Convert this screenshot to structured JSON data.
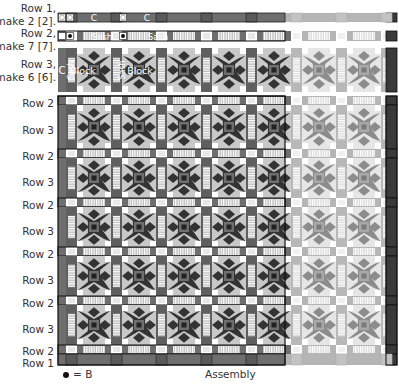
{
  "title": "Assembly",
  "legend": {
    "symbol": "•",
    "text": "= B"
  },
  "rows_top": [
    {
      "label_line1": "Row 1,",
      "label_line2": "make 2 [2]."
    },
    {
      "label_line1": "Row 2,",
      "label_line2": "make 7 [7]."
    },
    {
      "label_line1": "Row 3,",
      "label_line2": "make 6 [6]."
    }
  ],
  "piece_labels": {
    "c": "C",
    "sash": "Sash",
    "block": "Block"
  },
  "assembly_row_labels": [
    "Row 2",
    "Row 3",
    "Row 2",
    "Row 3",
    "Row 2",
    "Row 3",
    "Row 2",
    "Row 3",
    "Row 2",
    "Row 3",
    "Row 2",
    "Row 1"
  ],
  "colors": {
    "dark": "#3a3a3a",
    "mid": "#6e6e6e",
    "light": "#c8c8c8",
    "white": "#ffffff",
    "star": "#333333",
    "faded_dark": "#9a9a9a",
    "faded_light": "#dedede"
  }
}
